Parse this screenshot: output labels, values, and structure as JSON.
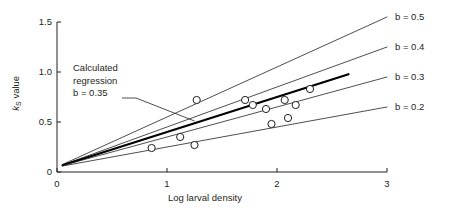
{
  "chart_data": {
    "type": "scatter",
    "title": "",
    "xlabel": "Log larval density",
    "ylabel_parts": {
      "symbol": "k",
      "subscript": "S",
      "rest": " value"
    },
    "ylabel": "kS value",
    "xlim": [
      0,
      3
    ],
    "ylim": [
      0,
      1.5
    ],
    "xticks": [
      "0",
      "1",
      "2",
      "3"
    ],
    "xtick_values": [
      0,
      1,
      2,
      3
    ],
    "yticks": [
      "0",
      "0.5",
      "1.0",
      "1.5"
    ],
    "ytick_values": [
      0,
      0.5,
      1.0,
      1.5
    ],
    "grid": false,
    "legend_position": "right-of-axes",
    "points": [
      {
        "x": 0.86,
        "y": 0.24
      },
      {
        "x": 1.12,
        "y": 0.35
      },
      {
        "x": 1.25,
        "y": 0.27
      },
      {
        "x": 1.27,
        "y": 0.72
      },
      {
        "x": 1.71,
        "y": 0.72
      },
      {
        "x": 1.78,
        "y": 0.67
      },
      {
        "x": 1.9,
        "y": 0.63
      },
      {
        "x": 1.95,
        "y": 0.48
      },
      {
        "x": 2.07,
        "y": 0.72
      },
      {
        "x": 2.1,
        "y": 0.54
      },
      {
        "x": 2.17,
        "y": 0.67
      },
      {
        "x": 2.3,
        "y": 0.83
      }
    ],
    "series": [
      {
        "name": "b = 0.5",
        "slope": 0.5,
        "intercept": 0.05,
        "label": "b = 0.5",
        "emphasis": false
      },
      {
        "name": "b = 0.4",
        "slope": 0.4,
        "intercept": 0.05,
        "label": "b = 0.4",
        "emphasis": false
      },
      {
        "name": "b = 0.35",
        "slope": 0.35,
        "intercept": 0.05,
        "label": "",
        "emphasis": true
      },
      {
        "name": "b = 0.3",
        "slope": 0.3,
        "intercept": 0.05,
        "label": "b = 0.3",
        "emphasis": false
      },
      {
        "name": "b = 0.2",
        "slope": 0.2,
        "intercept": 0.05,
        "label": "b = 0.2",
        "emphasis": false
      }
    ],
    "annotation": {
      "line1": "Calculated",
      "line2": "regression",
      "line3": "b = 0.35",
      "points_to": {
        "x": 1.25,
        "y": 0.51
      }
    }
  },
  "colors": {
    "axis": "#231f20",
    "text": "#231f20",
    "line": "#231f20",
    "emphasis_line": "#000000",
    "marker_stroke": "#231f20",
    "marker_fill": "#ffffff",
    "background": "#ffffff"
  }
}
